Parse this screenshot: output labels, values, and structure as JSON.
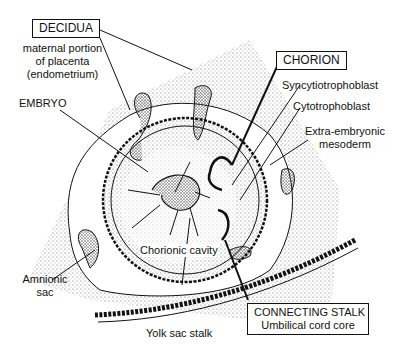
{
  "labels": {
    "decidua": {
      "title": "DECIDUA",
      "line1": "maternal portion",
      "line2": "of placenta",
      "line3": "(endometrium)"
    },
    "embryo": "EMBRYO",
    "chorion": "CHORION",
    "syncytiotrophoblast": "Syncytiotrophoblast",
    "cytotrophoblast": "Cytotrophoblast",
    "extra_embryonic": {
      "line1": "Extra-embryonic",
      "line2": "mesoderm"
    },
    "chorionic_cavity": "Chorionic cavity",
    "amnionic_sac": {
      "line1": "Amnionic",
      "line2": "sac"
    },
    "yolk_sac_stalk": "Yolk sac stalk",
    "connecting_stalk": {
      "title": "CONNECTING STALK",
      "subtitle": "Umbilical cord core"
    }
  },
  "colors": {
    "ink": "#111111",
    "stipple": "#9a9a9a",
    "background": "#ffffff"
  }
}
